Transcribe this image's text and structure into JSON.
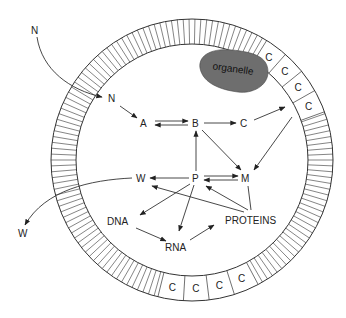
{
  "diagram": {
    "title": "",
    "cell": {
      "center": [
        192,
        160
      ],
      "outer_radius": 141,
      "inner_radius": 116,
      "membrane_tick_count": 150,
      "stroke_color": "#333333"
    },
    "organelle": {
      "label": "organelle",
      "fill_color": "#6e6e6e"
    },
    "membrane_cells": {
      "label": "C",
      "upper_right_count": 4,
      "bottom_count": 4
    },
    "nodes": {
      "n_outside": "N",
      "n_inside": "N",
      "a": "A",
      "b": "B",
      "c": "C",
      "w_inside": "W",
      "p": "P",
      "m": "M",
      "dna": "DNA",
      "rna": "RNA",
      "proteins": "PROTEINS",
      "w_outside": "W"
    },
    "edges": [
      {
        "from": "N (outside)",
        "to": "N (inside)",
        "type": "curved"
      },
      {
        "from": "N",
        "to": "A"
      },
      {
        "from": "A",
        "to": "B",
        "type": "reversible"
      },
      {
        "from": "B",
        "to": "C"
      },
      {
        "from": "B",
        "to": "M"
      },
      {
        "from": "C",
        "to": "C (membrane)"
      },
      {
        "from": "C (membrane)",
        "to": "M"
      },
      {
        "from": "P",
        "to": "B"
      },
      {
        "from": "P",
        "to": "W"
      },
      {
        "from": "P",
        "to": "M",
        "type": "reversible"
      },
      {
        "from": "P",
        "to": "DNA"
      },
      {
        "from": "P",
        "to": "RNA"
      },
      {
        "from": "DNA",
        "to": "RNA"
      },
      {
        "from": "RNA",
        "to": "PROTEINS"
      },
      {
        "from": "PROTEINS",
        "to": "P"
      },
      {
        "from": "PROTEINS",
        "to": "W"
      },
      {
        "from": "PROTEINS",
        "to": "M"
      },
      {
        "from": "W (inside)",
        "to": "W (outside)",
        "type": "curved"
      }
    ]
  }
}
